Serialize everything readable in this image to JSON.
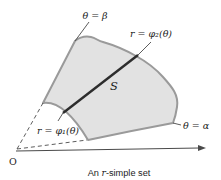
{
  "figure": {
    "caption": {
      "prefix": "An ",
      "var": "r",
      "suffix": "-simple set"
    },
    "labels": {
      "beta_ray": "θ = β",
      "alpha_ray": "θ = α",
      "outer_curve": "r = φ₂(θ)",
      "inner_curve": "r = φ₁(θ)",
      "region": "S",
      "origin": "O"
    },
    "colors": {
      "background": "#ffffff",
      "region_fill": "#e2e2e2",
      "boundary_stroke": "#9a9a9a",
      "segment_stroke": "#2d2d2d",
      "line_color": "#4a4a4a",
      "text_color": "#1c1c1c"
    }
  }
}
